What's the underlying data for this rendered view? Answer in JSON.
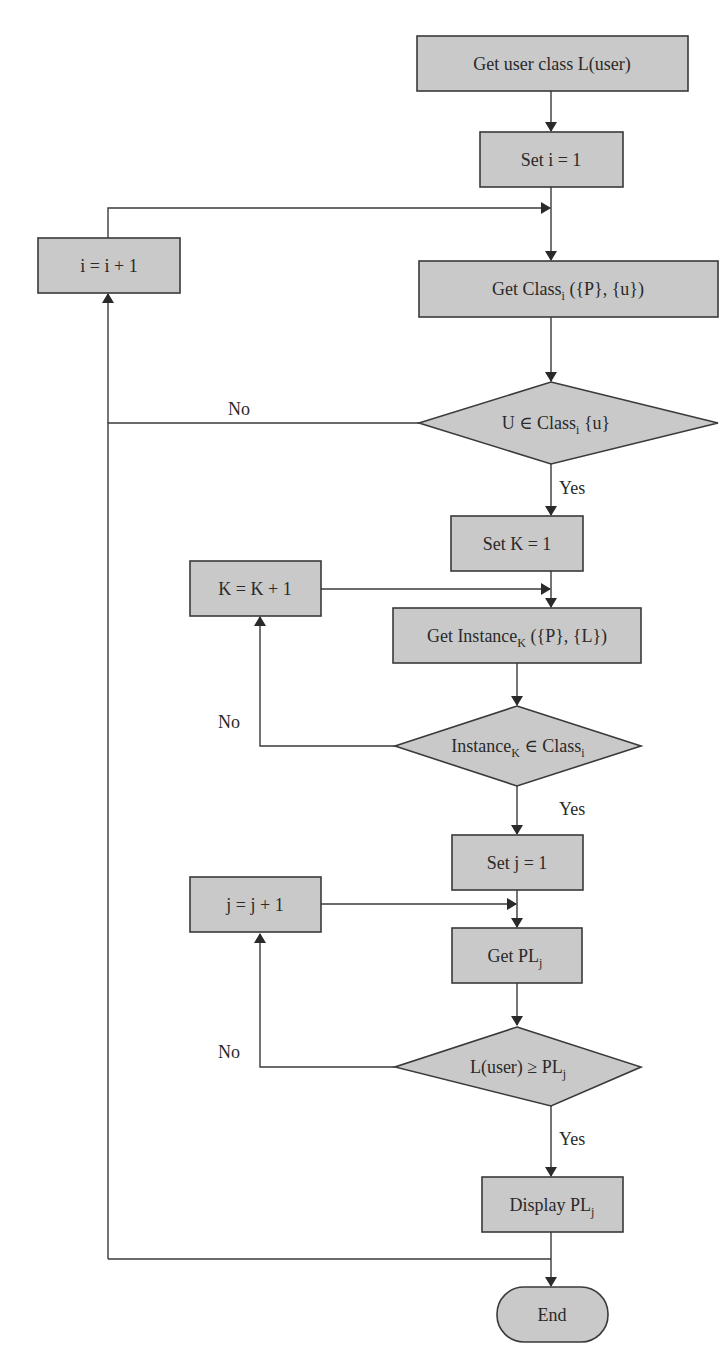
{
  "diagram": {
    "type": "flowchart",
    "colors": {
      "node_fill": "#c9c9c9",
      "stroke": "#3a3a3a",
      "text": "#2a2a2a",
      "background": "#ffffff"
    },
    "nodes": {
      "get_user_class": {
        "shape": "process",
        "text": "Get user class L(user)"
      },
      "set_i": {
        "shape": "process",
        "text": "Set i = 1"
      },
      "inc_i": {
        "shape": "process",
        "text": "i = i + 1"
      },
      "get_class": {
        "shape": "process",
        "text_main": "Get Class",
        "text_sub": "i",
        "text_tail": " ({P}, {u})"
      },
      "decision_u_in_class": {
        "shape": "decision",
        "text_main": "U ∈ Class",
        "text_sub": "i",
        "text_tail": " {u}"
      },
      "set_k": {
        "shape": "process",
        "text": "Set K = 1"
      },
      "inc_k": {
        "shape": "process",
        "text": "K = K + 1"
      },
      "get_instance": {
        "shape": "process",
        "text_main": "Get Instance",
        "text_sub": "K",
        "text_tail": " ({P}, {L})"
      },
      "decision_instance_in_class": {
        "shape": "decision",
        "text_main": "Instance",
        "text_sub": "K",
        "text_mid": " ∈ Class",
        "text_sub2": "i"
      },
      "set_j": {
        "shape": "process",
        "text": "Set j = 1"
      },
      "inc_j": {
        "shape": "process",
        "text": "j = j + 1"
      },
      "get_pl": {
        "shape": "process",
        "text_main": "Get PL",
        "text_sub": "j"
      },
      "decision_level": {
        "shape": "decision",
        "text_main": "L(user) ≥ PL",
        "text_sub": "j"
      },
      "display_pl": {
        "shape": "process",
        "text_main": "Display PL",
        "text_sub": "j"
      },
      "end": {
        "shape": "terminal",
        "text": "End"
      }
    },
    "edge_labels": {
      "no_1": "No",
      "yes_1": "Yes",
      "no_2": "No",
      "yes_2": "Yes",
      "no_3": "No",
      "yes_3": "Yes"
    },
    "edges": [
      {
        "from": "get_user_class",
        "to": "set_i"
      },
      {
        "from": "set_i",
        "to": "get_class"
      },
      {
        "from": "inc_i",
        "to": "get_class"
      },
      {
        "from": "get_class",
        "to": "decision_u_in_class"
      },
      {
        "from": "decision_u_in_class",
        "to": "inc_i",
        "label": "No"
      },
      {
        "from": "decision_u_in_class",
        "to": "set_k",
        "label": "Yes"
      },
      {
        "from": "set_k",
        "to": "get_instance"
      },
      {
        "from": "inc_k",
        "to": "get_instance"
      },
      {
        "from": "get_instance",
        "to": "decision_instance_in_class"
      },
      {
        "from": "decision_instance_in_class",
        "to": "inc_k",
        "label": "No"
      },
      {
        "from": "decision_instance_in_class",
        "to": "set_j",
        "label": "Yes"
      },
      {
        "from": "set_j",
        "to": "get_pl"
      },
      {
        "from": "inc_j",
        "to": "get_pl"
      },
      {
        "from": "get_pl",
        "to": "decision_level"
      },
      {
        "from": "decision_level",
        "to": "inc_j",
        "label": "No"
      },
      {
        "from": "decision_level",
        "to": "display_pl",
        "label": "Yes"
      },
      {
        "from": "display_pl",
        "to": "inc_i"
      },
      {
        "from": "display_pl",
        "to": "end"
      }
    ]
  }
}
